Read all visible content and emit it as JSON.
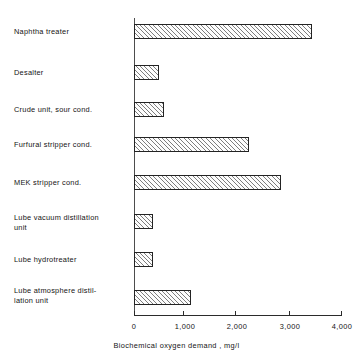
{
  "chart_data": {
    "type": "bar",
    "orientation": "horizontal",
    "title": "",
    "xlabel": "Biochemical oxygen demand , mg/l",
    "ylabel": "",
    "xlim": [
      0,
      4000
    ],
    "grid": false,
    "legend": null,
    "xticks": [
      0,
      1000,
      2000,
      3000,
      4000
    ],
    "xtick_labels": [
      "0",
      "1,000",
      "2,000",
      "3,000",
      "4,000"
    ],
    "categories": [
      "Naphtha treater",
      "Desalter",
      "Crude unit, sour cond.",
      "Furfural stripper cond.",
      "MEK stripper cond.",
      "Lube vacuum distillation\nunit",
      "Lube hydrotreater",
      "Lube atmosphere distil-\nlation unit"
    ],
    "values": [
      3440,
      480,
      580,
      2220,
      2840,
      370,
      370,
      1110
    ],
    "bar_style": {
      "fill": "hatched-diagonal",
      "edge_color": "#232323",
      "face_color": "#fdfdfd"
    }
  },
  "axis": {
    "x_title": "Biochemical oxygen demand , mg/l"
  }
}
